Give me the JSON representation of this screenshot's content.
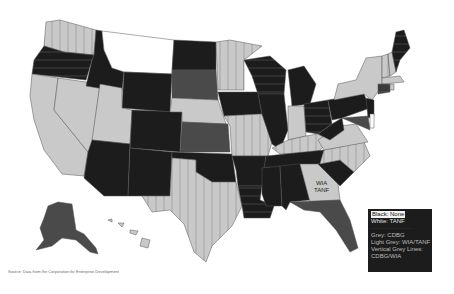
{
  "map": {
    "title": "",
    "colors": {
      "black": "#1c1c1c",
      "white": "#ffffff",
      "grey": "#4a4a4a",
      "light_grey": "#c9c9c9",
      "background": "#ffffff"
    },
    "state_label": {
      "state": "Georgia",
      "lines": [
        "WIA",
        "TANF"
      ]
    }
  },
  "legend": {
    "items": [
      {
        "label": "Black: None",
        "active": true
      },
      {
        "label": "White: TANF"
      },
      {
        "label": "———————",
        "dim": true
      },
      {
        "label": "Grey: CDBG"
      },
      {
        "label": "Light Grey: WIA/TANF"
      },
      {
        "label": "Vertical Grey Lines:"
      },
      {
        "label": "CDBG/WIA"
      }
    ]
  },
  "source": {
    "text": "Source: Data from the Corporation for Enterprise Development"
  }
}
